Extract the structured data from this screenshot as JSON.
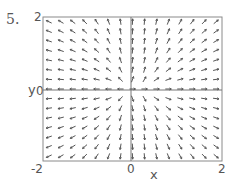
{
  "problem_number": "5.",
  "chart_data": {
    "type": "vector_field",
    "title": "",
    "xlabel": "x",
    "ylabel": "y",
    "xlim": [
      -2,
      2
    ],
    "ylim": [
      -2,
      2
    ],
    "x_tick_labels": [
      "-2",
      "0",
      "2"
    ],
    "y_tick_labels": [
      "0",
      "2"
    ],
    "axes_lines": {
      "x_zero": true,
      "y_zero": true
    },
    "grid": false,
    "arrow_grid": {
      "cols": 15,
      "rows": 15
    },
    "formula": null,
    "arrow_directions_note": "Approximate directions read from the image; exact field equation not determined.",
    "quadrant_directions": {
      "upper_left": "left, tilting upward near x=0",
      "upper_right": "up and right, near-vertical close to x=0, near-horizontal close to y=0",
      "lower_left": "down and left, near-vertical close to x=0",
      "lower_right": "right, tilting downward near x=0"
    }
  },
  "labels": {
    "y_top": "2",
    "y_axis": "y",
    "y_zero": "0",
    "x_left": "-2",
    "x_zero": "0",
    "x_right": "2",
    "x_axis": "x"
  },
  "colors": {
    "frame": "#8a8a8a",
    "arrow": "#555555",
    "axis": "#777777"
  }
}
